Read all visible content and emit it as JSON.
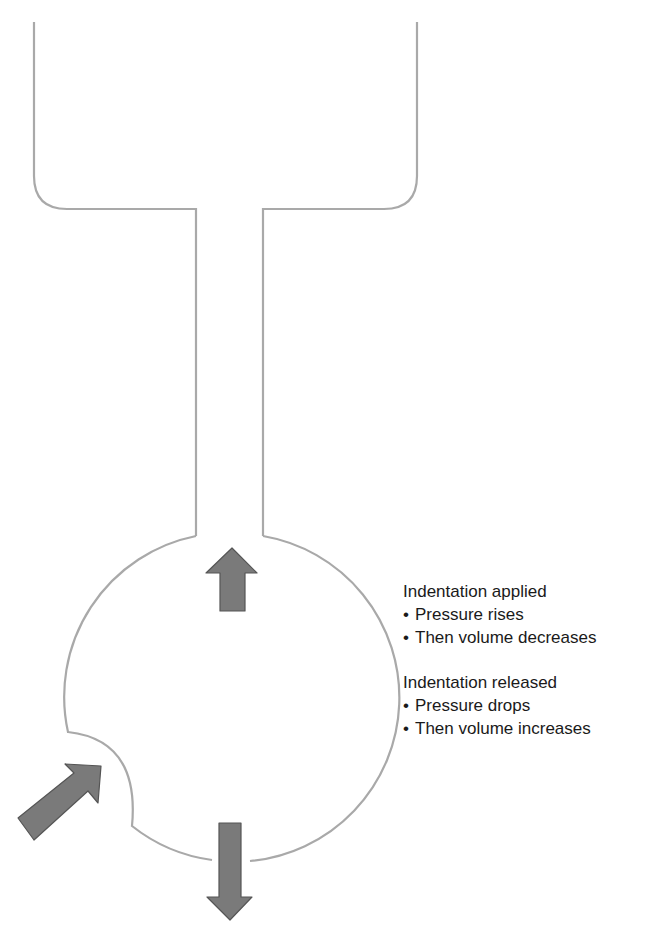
{
  "diagram": {
    "title": "",
    "colors": {
      "outline": "#a9a9a9",
      "arrow_fill": "#7a7a7a",
      "arrow_stroke": "#555555",
      "text": "#1a1a1a"
    },
    "components": [
      {
        "name": "reservoir",
        "description": "upper reservoir with rounded bottom corners"
      },
      {
        "name": "neck",
        "description": "narrow connecting tube"
      },
      {
        "name": "bulb",
        "description": "round chamber with an indentation at lower left"
      }
    ],
    "arrows": [
      {
        "name": "indentation-arrow",
        "direction": "up-right",
        "meaning": "indentation applied"
      },
      {
        "name": "up-arrow",
        "direction": "up",
        "meaning": "fluid moves up the neck"
      },
      {
        "name": "down-arrow",
        "direction": "down",
        "meaning": "pressure/volume change outward"
      }
    ]
  },
  "labels": {
    "applied": {
      "heading": "Indentation applied",
      "bullets": [
        "Pressure rises",
        "Then volume decreases"
      ]
    },
    "released": {
      "heading": "Indentation released",
      "bullets": [
        "Pressure drops",
        "Then volume increases"
      ]
    },
    "bullet_char": "•"
  }
}
